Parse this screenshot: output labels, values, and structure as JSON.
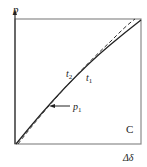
{
  "diagram": {
    "y_axis_label": "p",
    "x_axis_label": "Δδ",
    "panel_label": "C",
    "curve_labels": [
      {
        "name": "t",
        "sub": "2"
      },
      {
        "name": "t",
        "sub": "1"
      }
    ],
    "point_label": {
      "name": "p",
      "sub": "1"
    },
    "colors": {
      "line": "#222222",
      "frame": "#888888",
      "background": "#ffffff"
    },
    "curves": [
      {
        "id": "t1",
        "style": "solid",
        "description": "slightly concave curve from origin to top-right"
      },
      {
        "id": "t2",
        "style": "dashed",
        "description": "near-straight line diverging above t1 near top-right"
      }
    ]
  }
}
